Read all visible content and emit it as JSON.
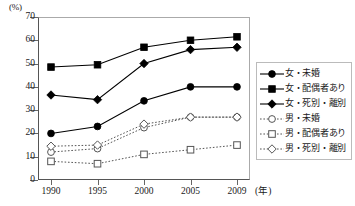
{
  "axes": {
    "y_unit": "(%)",
    "y_ticks": [
      70,
      60,
      50,
      40,
      30,
      20,
      10,
      0
    ],
    "x_ticks": [
      "1990",
      "1995",
      "2000",
      "2005",
      "2009"
    ],
    "x_unit": "(年)"
  },
  "legend": {
    "items": [
      {
        "label": "女・未婚",
        "marker": "filled-circle",
        "line": "solid"
      },
      {
        "label": "女・配偶者あり",
        "marker": "filled-square",
        "line": "solid"
      },
      {
        "label": "女・死別・離別",
        "marker": "filled-diamond",
        "line": "solid"
      },
      {
        "label": "男・未婚",
        "marker": "open-circle",
        "line": "dotted"
      },
      {
        "label": "男・配偶者あり",
        "marker": "open-square",
        "line": "dotted"
      },
      {
        "label": "男・死別・離別",
        "marker": "open-diamond",
        "line": "dotted"
      }
    ]
  },
  "chart_data": {
    "type": "line",
    "title": "",
    "xlabel": "(年)",
    "ylabel": "(%)",
    "x": [
      1990,
      1995,
      2000,
      2005,
      2009
    ],
    "categories": [
      "1990",
      "1995",
      "2000",
      "2005",
      "2009"
    ],
    "ylim": [
      0,
      70
    ],
    "ytick_step": 10,
    "grid": false,
    "legend_position": "right",
    "series": [
      {
        "name": "女・未婚",
        "values": [
          20,
          23,
          34,
          40,
          40
        ],
        "marker": "filled-circle",
        "line": "solid",
        "color": "#000000"
      },
      {
        "name": "女・配偶者あり",
        "values": [
          48.5,
          49.5,
          57,
          60,
          61.5
        ],
        "marker": "filled-square",
        "line": "solid",
        "color": "#000000"
      },
      {
        "name": "女・死別・離別",
        "values": [
          36.5,
          34.5,
          50,
          56,
          57
        ],
        "marker": "filled-diamond",
        "line": "solid",
        "color": "#000000"
      },
      {
        "name": "男・未婚",
        "values": [
          12,
          13.5,
          22.5,
          27,
          27
        ],
        "marker": "open-circle",
        "line": "dotted",
        "color": "#555555"
      },
      {
        "name": "男・配偶者あり",
        "values": [
          8,
          7,
          11,
          13,
          15
        ],
        "marker": "open-square",
        "line": "dotted",
        "color": "#555555"
      },
      {
        "name": "男・死別・離別",
        "values": [
          14.5,
          15,
          24,
          27,
          27
        ],
        "marker": "open-diamond",
        "line": "dotted",
        "color": "#555555"
      }
    ]
  }
}
